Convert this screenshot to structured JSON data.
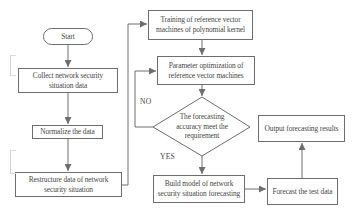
{
  "figure": {
    "type": "flowchart",
    "background": "#ffffff",
    "line_color": "#6e6e6e",
    "text_color": "#474747",
    "nodes": {
      "start": "Start",
      "collect": "Collect network security\nsituation data",
      "normalize": "Normalize the data",
      "restructure": "Restructure data of network\nsecurity situation",
      "training": "Training of reference vector\nmachines of polynomial kernel",
      "parameter": "Parameter optimization of\nreference vector machines",
      "decision": "The forecasting\naccuracy meet the\nrequirement",
      "build": "Build model of network\nsecurity situation forecasting",
      "forecast": "Forecast the test data",
      "output": "Output forecasting results"
    },
    "edge_labels": {
      "no": "NO",
      "yes": "YES"
    }
  }
}
